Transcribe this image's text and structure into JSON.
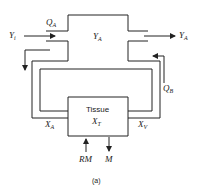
{
  "diagram": {
    "labels": {
      "QA": {
        "main": "Q",
        "sub": "A"
      },
      "Yi": {
        "main": "Y",
        "sub": "i"
      },
      "YA_center": {
        "main": "Y",
        "sub": "A"
      },
      "YA_out": {
        "main": "Y",
        "sub": "A"
      },
      "QB": {
        "main": "Q",
        "sub": "B"
      },
      "XA": {
        "main": "X",
        "sub": "A"
      },
      "XV": {
        "main": "X",
        "sub": "V"
      },
      "XT": {
        "main": "X",
        "sub": "T"
      },
      "tissue": "Tissue",
      "RM": "RM",
      "M": "M"
    },
    "caption": "(a)",
    "line_color": "#222222"
  }
}
